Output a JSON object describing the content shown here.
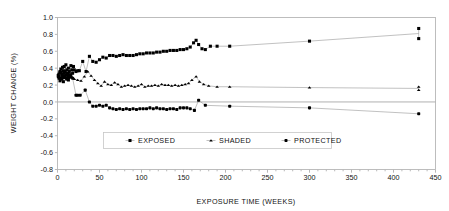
{
  "chart_data": {
    "type": "scatter",
    "title": "",
    "xlabel": "EXPOSURE TIME (WEEKS)",
    "ylabel": "WEIGHT CHANGE (%)",
    "xlim": [
      0,
      450
    ],
    "ylim": [
      -0.8,
      1.0
    ],
    "xticks": [
      0,
      50,
      100,
      150,
      200,
      250,
      300,
      350,
      400,
      450
    ],
    "xtick_labels": [
      "0",
      "50",
      "100",
      "150",
      "200",
      "250",
      "300",
      "350",
      "400",
      "450"
    ],
    "yticks": [
      -0.8,
      -0.6,
      -0.4,
      -0.2,
      0.0,
      0.2,
      0.4,
      0.6,
      0.8,
      1.0
    ],
    "ytick_labels": [
      "-0.8",
      "-0.6",
      "-0.4",
      "-0.2",
      "0.0",
      "0.2",
      "0.4",
      "0.6",
      "0.8",
      "1.0"
    ],
    "grid": false,
    "legend_position": "inside-lower-center",
    "zero_reference_line": 0.0,
    "marker_color": "#000000",
    "line_color": "#8d8d8d",
    "series": [
      {
        "name": "EXPOSED",
        "marker": "square",
        "points": [
          [
            1,
            0.3
          ],
          [
            2,
            0.33
          ],
          [
            2,
            0.28
          ],
          [
            3,
            0.36
          ],
          [
            3,
            0.25
          ],
          [
            4,
            0.39
          ],
          [
            4,
            0.31
          ],
          [
            5,
            0.27
          ],
          [
            5,
            0.35
          ],
          [
            6,
            0.41
          ],
          [
            6,
            0.3
          ],
          [
            7,
            0.24
          ],
          [
            7,
            0.37
          ],
          [
            8,
            0.33
          ],
          [
            8,
            0.42
          ],
          [
            9,
            0.29
          ],
          [
            9,
            0.36
          ],
          [
            10,
            0.31
          ],
          [
            10,
            0.44
          ],
          [
            11,
            0.27
          ],
          [
            11,
            0.38
          ],
          [
            12,
            0.34
          ],
          [
            12,
            0.3
          ],
          [
            13,
            0.4
          ],
          [
            13,
            0.26
          ],
          [
            14,
            0.36
          ],
          [
            15,
            0.32
          ],
          [
            16,
            0.43
          ],
          [
            17,
            0.38
          ],
          [
            18,
            0.34
          ],
          [
            19,
            0.42
          ],
          [
            20,
            0.38
          ],
          [
            22,
            0.36
          ],
          [
            24,
            0.37
          ],
          [
            26,
            0.37
          ],
          [
            30,
            0.48
          ],
          [
            34,
            0.36
          ],
          [
            38,
            0.54
          ],
          [
            42,
            0.48
          ],
          [
            46,
            0.47
          ],
          [
            50,
            0.5
          ],
          [
            54,
            0.53
          ],
          [
            58,
            0.52
          ],
          [
            62,
            0.55
          ],
          [
            66,
            0.55
          ],
          [
            70,
            0.54
          ],
          [
            74,
            0.55
          ],
          [
            78,
            0.56
          ],
          [
            82,
            0.55
          ],
          [
            86,
            0.55
          ],
          [
            90,
            0.55
          ],
          [
            94,
            0.56
          ],
          [
            98,
            0.57
          ],
          [
            102,
            0.57
          ],
          [
            106,
            0.58
          ],
          [
            110,
            0.58
          ],
          [
            114,
            0.58
          ],
          [
            118,
            0.59
          ],
          [
            122,
            0.59
          ],
          [
            126,
            0.6
          ],
          [
            130,
            0.6
          ],
          [
            134,
            0.61
          ],
          [
            138,
            0.61
          ],
          [
            142,
            0.61
          ],
          [
            146,
            0.62
          ],
          [
            150,
            0.62
          ],
          [
            154,
            0.63
          ],
          [
            158,
            0.65
          ],
          [
            162,
            0.7
          ],
          [
            165,
            0.73
          ],
          [
            168,
            0.68
          ],
          [
            172,
            0.63
          ],
          [
            176,
            0.62
          ],
          [
            182,
            0.66
          ],
          [
            190,
            0.66
          ],
          [
            205,
            0.66
          ],
          [
            300,
            0.72
          ],
          [
            430,
            0.87
          ],
          [
            430,
            0.75
          ]
        ]
      },
      {
        "name": "SHADED",
        "marker": "triangle",
        "points": [
          [
            1,
            0.31
          ],
          [
            2,
            0.29
          ],
          [
            3,
            0.34
          ],
          [
            4,
            0.27
          ],
          [
            5,
            0.32
          ],
          [
            6,
            0.36
          ],
          [
            7,
            0.3
          ],
          [
            8,
            0.33
          ],
          [
            9,
            0.28
          ],
          [
            10,
            0.35
          ],
          [
            11,
            0.31
          ],
          [
            12,
            0.29
          ],
          [
            13,
            0.34
          ],
          [
            14,
            0.32
          ],
          [
            15,
            0.3
          ],
          [
            16,
            0.33
          ],
          [
            18,
            0.29
          ],
          [
            20,
            0.27
          ],
          [
            24,
            0.26
          ],
          [
            28,
            0.25
          ],
          [
            32,
            0.3
          ],
          [
            36,
            0.36
          ],
          [
            40,
            0.31
          ],
          [
            44,
            0.26
          ],
          [
            48,
            0.22
          ],
          [
            52,
            0.19
          ],
          [
            56,
            0.24
          ],
          [
            60,
            0.21
          ],
          [
            64,
            0.2
          ],
          [
            68,
            0.23
          ],
          [
            72,
            0.21
          ],
          [
            76,
            0.18
          ],
          [
            80,
            0.19
          ],
          [
            84,
            0.2
          ],
          [
            88,
            0.19
          ],
          [
            92,
            0.18
          ],
          [
            96,
            0.19
          ],
          [
            100,
            0.21
          ],
          [
            104,
            0.18
          ],
          [
            108,
            0.19
          ],
          [
            112,
            0.19
          ],
          [
            116,
            0.2
          ],
          [
            120,
            0.19
          ],
          [
            124,
            0.21
          ],
          [
            128,
            0.2
          ],
          [
            132,
            0.2
          ],
          [
            136,
            0.19
          ],
          [
            140,
            0.2
          ],
          [
            144,
            0.19
          ],
          [
            148,
            0.2
          ],
          [
            152,
            0.21
          ],
          [
            156,
            0.22
          ],
          [
            160,
            0.26
          ],
          [
            165,
            0.3
          ],
          [
            169,
            0.24
          ],
          [
            174,
            0.21
          ],
          [
            180,
            0.19
          ],
          [
            190,
            0.18
          ],
          [
            205,
            0.18
          ],
          [
            300,
            0.17
          ],
          [
            430,
            0.18
          ],
          [
            430,
            0.14
          ]
        ]
      },
      {
        "name": "PROTECTED",
        "marker": "circle",
        "points": [
          [
            1,
            0.32
          ],
          [
            2,
            0.3
          ],
          [
            3,
            0.35
          ],
          [
            4,
            0.28
          ],
          [
            5,
            0.33
          ],
          [
            6,
            0.31
          ],
          [
            7,
            0.29
          ],
          [
            8,
            0.34
          ],
          [
            9,
            0.3
          ],
          [
            10,
            0.32
          ],
          [
            11,
            0.28
          ],
          [
            12,
            0.33
          ],
          [
            13,
            0.31
          ],
          [
            14,
            0.29
          ],
          [
            16,
            0.3
          ],
          [
            18,
            0.28
          ],
          [
            22,
            0.08
          ],
          [
            24,
            0.08
          ],
          [
            27,
            0.08
          ],
          [
            33,
            0.14
          ],
          [
            38,
            0.0
          ],
          [
            42,
            -0.05
          ],
          [
            46,
            -0.05
          ],
          [
            50,
            -0.04
          ],
          [
            54,
            -0.05
          ],
          [
            58,
            -0.04
          ],
          [
            62,
            -0.07
          ],
          [
            66,
            -0.08
          ],
          [
            70,
            -0.09
          ],
          [
            74,
            -0.08
          ],
          [
            78,
            -0.09
          ],
          [
            82,
            -0.08
          ],
          [
            86,
            -0.09
          ],
          [
            90,
            -0.08
          ],
          [
            94,
            -0.09
          ],
          [
            98,
            -0.08
          ],
          [
            102,
            -0.08
          ],
          [
            106,
            -0.08
          ],
          [
            110,
            -0.07
          ],
          [
            114,
            -0.08
          ],
          [
            118,
            -0.07
          ],
          [
            122,
            -0.08
          ],
          [
            126,
            -0.08
          ],
          [
            130,
            -0.09
          ],
          [
            134,
            -0.08
          ],
          [
            138,
            -0.08
          ],
          [
            142,
            -0.09
          ],
          [
            146,
            -0.07
          ],
          [
            150,
            -0.07
          ],
          [
            154,
            -0.07
          ],
          [
            158,
            -0.08
          ],
          [
            163,
            -0.1
          ],
          [
            168,
            0.02
          ],
          [
            176,
            -0.04
          ],
          [
            205,
            -0.05
          ],
          [
            300,
            -0.07
          ],
          [
            430,
            -0.14
          ]
        ]
      }
    ]
  },
  "legend": {
    "items": [
      {
        "label": "EXPOSED",
        "marker": "square"
      },
      {
        "label": "SHADED",
        "marker": "triangle"
      },
      {
        "label": "PROTECTED",
        "marker": "circle"
      }
    ]
  }
}
